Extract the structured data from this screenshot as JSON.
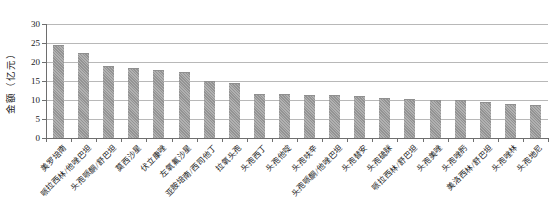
{
  "chart_data": {
    "type": "bar",
    "title": "",
    "xlabel": "",
    "ylabel": "金额（亿元）",
    "ylim": [
      0,
      30
    ],
    "yticks": [
      0,
      5,
      10,
      15,
      20,
      25,
      30
    ],
    "grid": true,
    "legend_position": "none",
    "bar_color": "#9b9b9b",
    "gridline_color": "#b8b8b8",
    "axis_color": "#6e6e6e",
    "categories": [
      "美罗培南",
      "哌拉西林/他唑巴坦",
      "头孢哌酮/舒巴坦",
      "莫西沙星",
      "伏立康唑",
      "左氧氟沙星",
      "亚胺培南/西司他丁",
      "拉氧头孢",
      "头孢西丁",
      "头孢他啶",
      "头孢呋辛",
      "头孢哌酮/他唑巴坦",
      "头孢替安",
      "头孢硫脒",
      "哌拉西林/舒巴坦",
      "头孢美唑",
      "头孢唑肟",
      "美洛西林/舒巴坦",
      "头孢唑林",
      "头孢地尼"
    ],
    "values": [
      24.4,
      22.4,
      18.9,
      18.4,
      17.9,
      17.3,
      15.1,
      14.4,
      11.7,
      11.6,
      11.4,
      11.2,
      11.1,
      10.6,
      10.3,
      10.0,
      10.0,
      9.4,
      9.0,
      8.8
    ]
  }
}
